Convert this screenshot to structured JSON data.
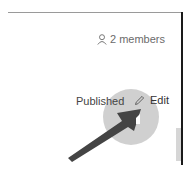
{
  "header": {
    "members_icon": "person-icon",
    "members_label": "2 members"
  },
  "status": {
    "published_label": "Published"
  },
  "actions": {
    "edit_icon": "pencil-icon",
    "edit_label": "Edit"
  },
  "annotation": {
    "type": "arrow-callout",
    "highlight_color": "#c8c8c8",
    "arrow_color": "#444444"
  }
}
